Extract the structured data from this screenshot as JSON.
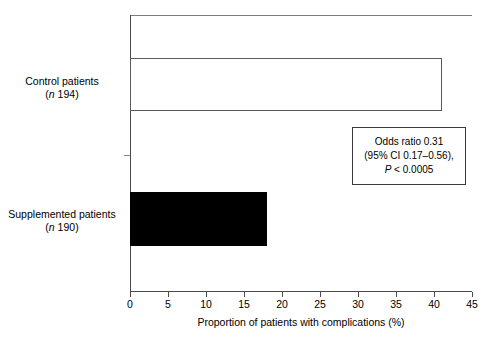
{
  "chart_data": {
    "type": "bar",
    "orientation": "horizontal",
    "title": "",
    "xlabel": "Proportion of patients with complications (%)",
    "ylabel": "",
    "xlim": [
      0,
      45
    ],
    "xticks": [
      0,
      5,
      10,
      15,
      20,
      25,
      30,
      35,
      40,
      45
    ],
    "xtick_labels": [
      "0",
      "5",
      "10",
      "15",
      "20",
      "25",
      "30",
      "35",
      "40",
      "45"
    ],
    "grid": false,
    "legend": false,
    "categories": [
      "Control patients (n 194)",
      "Supplemented patients (n 190)"
    ],
    "values": [
      41,
      18
    ],
    "series": [
      {
        "name": "Proportion with complications",
        "values": [
          41,
          18
        ],
        "bar_styles": [
          "open-white-outline",
          "solid-black"
        ]
      }
    ],
    "annotations": [
      "Odds ratio 0.31",
      "(95% CI 0.17–0.56),",
      "P < 0.0005"
    ]
  },
  "axes": {
    "x_title": "Proportion of patients with complications (%)",
    "x_ticks": [
      {
        "value": 0,
        "label": "0"
      },
      {
        "value": 5,
        "label": "5"
      },
      {
        "value": 10,
        "label": "10"
      },
      {
        "value": 15,
        "label": "15"
      },
      {
        "value": 20,
        "label": "20"
      },
      {
        "value": 25,
        "label": "25"
      },
      {
        "value": 30,
        "label": "30"
      },
      {
        "value": 35,
        "label": "35"
      },
      {
        "value": 40,
        "label": "40"
      },
      {
        "value": 45,
        "label": "45"
      }
    ]
  },
  "categories": [
    {
      "id": "control",
      "line1": "Control patients",
      "n_symbol": "n",
      "n_value": "194",
      "value": 41,
      "fill": "#ffffff",
      "stroke": "#5a5a5a"
    },
    {
      "id": "supplemented",
      "line1": "Supplemented patients",
      "n_symbol": "n",
      "n_value": "190",
      "value": 18,
      "fill": "#000000",
      "stroke": "#000000"
    }
  ],
  "annotation": {
    "line1": "Odds ratio 0.31",
    "line2": "(95% CI 0.17–0.56),",
    "line3_symbol": "P",
    "line3_rest": "< 0.0005"
  }
}
